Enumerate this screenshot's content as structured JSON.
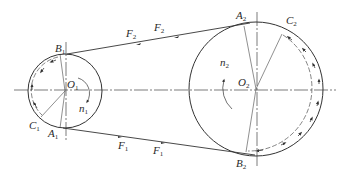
{
  "diagram": {
    "type": "belt-drive",
    "colors": {
      "line": "#333333",
      "background": "#ffffff"
    },
    "pulleys": [
      {
        "id": "small",
        "center_label": "O",
        "center_sub": "1",
        "speed_label": "n",
        "speed_sub": "1",
        "cx": 65,
        "cy": 91,
        "r": 37
      },
      {
        "id": "large",
        "center_label": "O",
        "center_sub": "2",
        "speed_label": "n",
        "speed_sub": "2",
        "cx": 256,
        "cy": 89,
        "r": 67
      }
    ],
    "points": {
      "B1": {
        "label": "B",
        "sub": "1"
      },
      "A1": {
        "label": "A",
        "sub": "1"
      },
      "C1": {
        "label": "C",
        "sub": "1"
      },
      "A2": {
        "label": "A",
        "sub": "2"
      },
      "B2": {
        "label": "B",
        "sub": "2"
      },
      "C2": {
        "label": "C",
        "sub": "2"
      }
    },
    "forces": {
      "upper": [
        {
          "label": "F",
          "sub": "2"
        },
        {
          "label": "F",
          "sub": "2"
        }
      ],
      "lower": [
        {
          "label": "F",
          "sub": "1"
        },
        {
          "label": "F",
          "sub": "1"
        }
      ]
    }
  }
}
